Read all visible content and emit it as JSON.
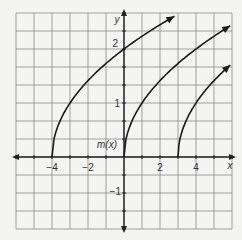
{
  "chart_data": {
    "type": "line",
    "title": "",
    "xlabel": "x",
    "ylabel": "y",
    "xlim": [
      -6,
      6
    ],
    "ylim": [
      -1.33,
      2.67
    ],
    "grid": true,
    "x_ticks": [
      -4,
      -2,
      2,
      4
    ],
    "x_tick_labels": [
      "−4",
      "−2",
      "2",
      "4"
    ],
    "y_ticks": [
      2,
      1,
      -1
    ],
    "y_tick_labels": [
      "2",
      "1",
      "−1"
    ],
    "annotations": [
      {
        "text": "m(x)",
        "x": -0.3,
        "y": 0.3
      }
    ],
    "series": [
      {
        "name": "curve shifted left 4",
        "formula": "sqrt(x+4)",
        "start": [
          -4,
          0
        ],
        "x": [
          -4,
          -3,
          -2,
          -1,
          0,
          1,
          2,
          2.8
        ],
        "values": [
          0,
          1,
          1.41,
          1.73,
          2,
          2.24,
          2.45,
          2.61
        ]
      },
      {
        "name": "m(x)",
        "formula": "sqrt(x)",
        "start": [
          0,
          0
        ],
        "x": [
          0,
          1,
          2,
          3,
          4,
          5,
          5.9
        ],
        "values": [
          0,
          1,
          1.41,
          1.73,
          2,
          2.24,
          2.43
        ]
      },
      {
        "name": "curve shifted right 3",
        "formula": "sqrt(x-3)",
        "start": [
          3,
          0
        ],
        "x": [
          3,
          4,
          5,
          5.9
        ],
        "values": [
          0,
          1,
          1.41,
          1.7
        ]
      }
    ],
    "colors": {
      "curve": "#1a1a1a",
      "grid": "#8a8a8a",
      "axis": "#222222",
      "background": "#f4f4f2"
    }
  }
}
